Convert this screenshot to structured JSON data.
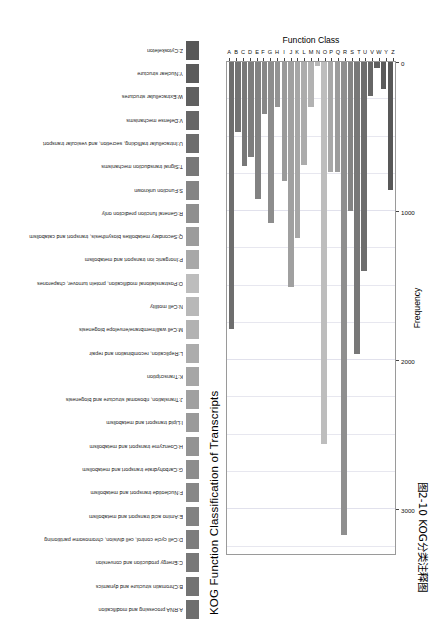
{
  "figure": {
    "caption_cn": "图2-10  KOG分类注释图"
  },
  "chart_data": {
    "type": "bar",
    "orientation": "horizontal-rotated",
    "title": "KOG Function Classification of Transcripts",
    "xlabel": "Function Class",
    "ylabel": "Frequency",
    "ylim": [
      0,
      3300
    ],
    "yticks": [
      0,
      1000,
      2000,
      3000
    ],
    "ytick_labels": [
      "0",
      "1000",
      "2000",
      "3000"
    ],
    "grid": true,
    "legend_position": "top",
    "categories": [
      "A",
      "B",
      "C",
      "D",
      "E",
      "F",
      "G",
      "H",
      "I",
      "J",
      "K",
      "L",
      "M",
      "N",
      "O",
      "P",
      "Q",
      "R",
      "S",
      "T",
      "U",
      "V",
      "W",
      "Y",
      "Z"
    ],
    "values": [
      1790,
      470,
      700,
      640,
      920,
      350,
      1080,
      300,
      800,
      1510,
      1180,
      690,
      300,
      30,
      2560,
      740,
      740,
      3170,
      1000,
      1960,
      1400,
      230,
      40,
      180,
      860
    ],
    "legend": [
      {
        "code": "A",
        "label": "A:RNA processing and modification",
        "color": "#6e6e6e"
      },
      {
        "code": "B",
        "label": "B:Chromatin structure and dynamics",
        "color": "#737373"
      },
      {
        "code": "C",
        "label": "C:Energy production and conversion",
        "color": "#787878"
      },
      {
        "code": "D",
        "label": "D:Cell cycle control, cell division, chromosome partitioning",
        "color": "#7d7d7d"
      },
      {
        "code": "E",
        "label": "E:Amino acid transport and metabolism",
        "color": "#828282"
      },
      {
        "code": "F",
        "label": "F:Nucleotide transport and metabolism",
        "color": "#878787"
      },
      {
        "code": "G",
        "label": "G:Carbohydrate transport and metabolism",
        "color": "#8d8d8d"
      },
      {
        "code": "H",
        "label": "H:Coenzyme transport and metabolism",
        "color": "#939393"
      },
      {
        "code": "I",
        "label": "I:Lipid transport and metabolism",
        "color": "#9a9a9a"
      },
      {
        "code": "J",
        "label": "J:Translation, ribosomal structure and biogenesis",
        "color": "#a0a0a0"
      },
      {
        "code": "K",
        "label": "K:Transcription",
        "color": "#a6a6a6"
      },
      {
        "code": "L",
        "label": "L:Replication, recombination and repair",
        "color": "#acacac"
      },
      {
        "code": "M",
        "label": "M:Cell wall/membrane/envelope biogenesis",
        "color": "#b2b2b2"
      },
      {
        "code": "N",
        "label": "N:Cell motility",
        "color": "#b8b8b8"
      },
      {
        "code": "O",
        "label": "O:Postranslational modification, protein turnover, chaperones",
        "color": "#bdbdbd"
      },
      {
        "code": "P",
        "label": "P:Inorganic ion transport and metabolism",
        "color": "#a8a8a8"
      },
      {
        "code": "Q",
        "label": "Q:Secondary metabolites biosynthesis, transport and catabolism",
        "color": "#9c9c9c"
      },
      {
        "code": "R",
        "label": "R:General function prediction only",
        "color": "#8f8f8f"
      },
      {
        "code": "S",
        "label": "S:Function unknown",
        "color": "#848484"
      },
      {
        "code": "T",
        "label": "T:Signal transduction mechanisms",
        "color": "#787878"
      },
      {
        "code": "U",
        "label": "U:Intracellular trafficking, secretion, and vesicular transport",
        "color": "#6d6d6d"
      },
      {
        "code": "V",
        "label": "V:Defense mechanisms",
        "color": "#666666"
      },
      {
        "code": "W",
        "label": "W:Extracellular structures",
        "color": "#606060"
      },
      {
        "code": "Y",
        "label": "Y:Nuclear structure",
        "color": "#5b5b5b"
      },
      {
        "code": "Z",
        "label": "Z:Cytoskeleton",
        "color": "#585858"
      }
    ]
  }
}
